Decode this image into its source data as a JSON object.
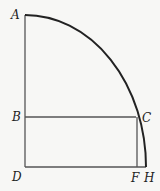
{
  "diagram": {
    "type": "geometry-quarter-circle",
    "points": {
      "A": {
        "label": "A",
        "x": 25,
        "y": 15
      },
      "B": {
        "label": "B",
        "x": 25,
        "y": 117
      },
      "C": {
        "label": "C",
        "x": 136,
        "y": 117
      },
      "D": {
        "label": "D",
        "x": 25,
        "y": 167
      },
      "F": {
        "label": "F",
        "x": 137,
        "y": 167
      },
      "H": {
        "label": "H",
        "x": 146,
        "y": 167
      }
    },
    "segments": [
      "AD",
      "DH",
      "BC",
      "CF"
    ],
    "arcs": [
      "AH"
    ],
    "colors": {
      "background": "#f7f7f5",
      "lines": "#555555",
      "arc": "#222222"
    }
  }
}
